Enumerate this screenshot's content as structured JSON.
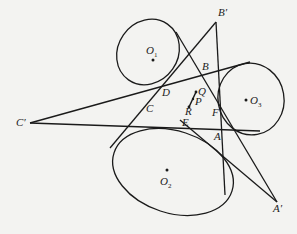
{
  "diagram": {
    "type": "geometry",
    "labels": {
      "B_prime": "B′",
      "A_prime": "A′",
      "C_prime": "C′",
      "O1": "O",
      "O1_sub": "1",
      "O2": "O",
      "O2_sub": "2",
      "O3": "O",
      "O3_sub": "3",
      "A": "A",
      "B": "B",
      "C": "C",
      "D": "D",
      "E": "E",
      "F": "F",
      "P": "P",
      "Q": "Q",
      "R": "R"
    },
    "colors": {
      "stroke": "#1a1a1a",
      "background": "#f3f3f1"
    }
  }
}
